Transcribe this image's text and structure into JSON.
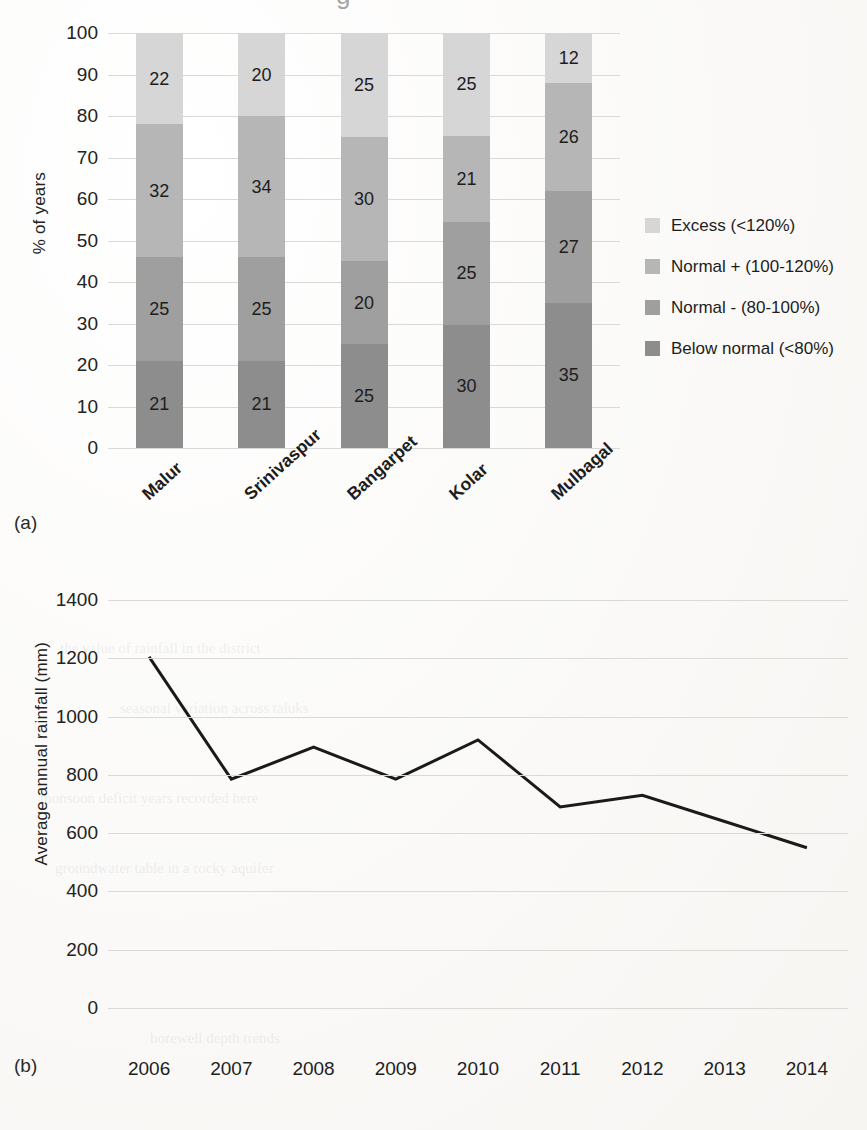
{
  "figure": {
    "panel_a_tag": "(a)",
    "panel_b_tag": "(b)",
    "top_cropped_glyph": "g"
  },
  "chart_data": [
    {
      "type": "bar",
      "subtype": "stacked-100",
      "panel": "(a)",
      "title": "",
      "xlabel": "",
      "ylabel": "% of years",
      "ylim": [
        0,
        100
      ],
      "yticks": [
        0,
        10,
        20,
        30,
        40,
        50,
        60,
        70,
        80,
        90,
        100
      ],
      "ytick_labels": [
        "0",
        "10",
        "20",
        "30",
        "40",
        "50",
        "60",
        "70",
        "80",
        "90",
        "100"
      ],
      "grid": true,
      "legend_position": "right",
      "categories": [
        "Malur",
        "Srinivaspur",
        "Bangarpet",
        "Kolar",
        "Mulbagal"
      ],
      "series": [
        {
          "name": "Below normal (<80%)",
          "color": "#8d8d8d",
          "values": [
            21,
            21,
            25,
            30,
            35
          ]
        },
        {
          "name": "Normal - (80-100%)",
          "color": "#9f9f9f",
          "values": [
            25,
            25,
            20,
            25,
            27
          ]
        },
        {
          "name": "Normal + (100-120%)",
          "color": "#b6b6b6",
          "values": [
            32,
            34,
            30,
            21,
            26
          ]
        },
        {
          "name": "Excess (<120%)",
          "color": "#d6d6d6",
          "values": [
            22,
            20,
            25,
            25,
            12
          ]
        }
      ],
      "legend_entries": [
        {
          "label": "Excess (<120%)",
          "color": "#d6d6d6"
        },
        {
          "label": "Normal + (100-120%)",
          "color": "#b6b6b6"
        },
        {
          "label": "Normal - (80-100%)",
          "color": "#9f9f9f"
        },
        {
          "label": "Below normal (<80%)",
          "color": "#8d8d8d"
        }
      ]
    },
    {
      "type": "line",
      "panel": "(b)",
      "title": "",
      "xlabel": "",
      "ylabel": "Average annual rainfall (mm)",
      "ylim": [
        0,
        1400
      ],
      "yticks": [
        0,
        200,
        400,
        600,
        800,
        1000,
        1200,
        1400
      ],
      "ytick_labels": [
        "0",
        "200",
        "400",
        "600",
        "800",
        "1000",
        "1200",
        "1400"
      ],
      "grid": true,
      "legend_position": "none",
      "line_color": "#1a1a1a",
      "x": [
        2006,
        2007,
        2008,
        2009,
        2010,
        2011,
        2012,
        2013,
        2014
      ],
      "xtick_labels": [
        "2006",
        "2007",
        "2008",
        "2009",
        "2010",
        "2011",
        "2012",
        "2013",
        "2014"
      ],
      "series": [
        {
          "name": "Average annual rainfall (mm)",
          "values": [
            1205,
            785,
            895,
            785,
            920,
            690,
            730,
            640,
            550
          ]
        }
      ]
    }
  ]
}
